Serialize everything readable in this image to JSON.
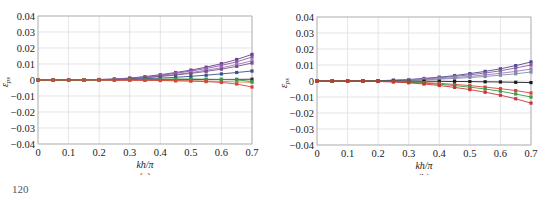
{
  "page_number": "120",
  "chart_data": [
    {
      "type": "line",
      "panel_label": "(a)",
      "title": "",
      "xlabel": "kh/π",
      "ylabel": "ε_ps",
      "xlim": [
        0,
        0.7
      ],
      "ylim": [
        -0.04,
        0.04
      ],
      "xticks": [
        "0",
        "0.1",
        "0.2",
        "0.3",
        "0.4",
        "0.5",
        "0.6",
        "0.7"
      ],
      "yticks": [
        "0.04",
        "0.03",
        "0.02",
        "0.01",
        "0",
        "-0.01",
        "-0.02",
        "-0.03",
        "-0.04"
      ],
      "grid": true,
      "legend": "none",
      "x": [
        0,
        0.05,
        0.1,
        0.15,
        0.2,
        0.25,
        0.3,
        0.35,
        0.4,
        0.45,
        0.5,
        0.55,
        0.6,
        0.65,
        0.7
      ],
      "series": [
        {
          "name": "s1",
          "color": "#6a3d8f",
          "values": [
            0,
            0,
            0,
            0.0001,
            0.0003,
            0.0006,
            0.0012,
            0.0021,
            0.0033,
            0.0047,
            0.0062,
            0.008,
            0.0102,
            0.0128,
            0.016
          ]
        },
        {
          "name": "s2",
          "color": "#8a5aa8",
          "values": [
            0,
            0,
            0,
            0.0001,
            0.0003,
            0.0005,
            0.0011,
            0.0019,
            0.0029,
            0.0042,
            0.0056,
            0.0072,
            0.0091,
            0.0114,
            0.0143
          ]
        },
        {
          "name": "s3",
          "color": "#9c7bb6",
          "values": [
            0,
            0,
            0,
            0.0001,
            0.0002,
            0.0004,
            0.0009,
            0.0016,
            0.0025,
            0.0035,
            0.0047,
            0.0061,
            0.0077,
            0.0097,
            0.012
          ]
        },
        {
          "name": "s4",
          "color": "#7a4f8c",
          "values": [
            0,
            0,
            0,
            0.0001,
            0.0002,
            0.0004,
            0.0008,
            0.0014,
            0.0022,
            0.0031,
            0.0041,
            0.0054,
            0.0068,
            0.0085,
            0.0106
          ]
        },
        {
          "name": "s5",
          "color": "#3a4f8f",
          "values": [
            0,
            0,
            0,
            0,
            0.0001,
            0.0002,
            0.0004,
            0.0008,
            0.0012,
            0.0017,
            0.0023,
            0.003,
            0.0038,
            0.0047,
            0.0056
          ]
        },
        {
          "name": "s6",
          "color": "#333333",
          "values": [
            0,
            0,
            0,
            0,
            0,
            0,
            0.0001,
            0.0001,
            0.0002,
            0.0002,
            0.0003,
            0.0003,
            0.0004,
            0.0004,
            0.0005
          ]
        },
        {
          "name": "s7",
          "color": "#d98a4e",
          "values": [
            0,
            0,
            0,
            0,
            0,
            -0.0001,
            -0.0001,
            -0.0002,
            -0.0003,
            -0.0004,
            -0.0005,
            -0.0007,
            -0.0009,
            -0.0012,
            -0.0015
          ]
        },
        {
          "name": "s8",
          "color": "#3a9a4a",
          "values": [
            0,
            0,
            0,
            0,
            0.0001,
            0.0002,
            0.0003,
            0.0004,
            0.0005,
            0.0006,
            0.0006,
            0.0005,
            0.0003,
            0.0001,
            -0.001
          ]
        },
        {
          "name": "s9",
          "color": "#d6453a",
          "values": [
            0,
            0,
            0,
            0,
            0,
            -0.0001,
            -0.0001,
            -0.0002,
            -0.0003,
            -0.0005,
            -0.0007,
            -0.001,
            -0.0015,
            -0.0025,
            -0.0044
          ]
        }
      ]
    },
    {
      "type": "line",
      "panel_label": "(b)",
      "title": "",
      "xlabel": "kh/π",
      "ylabel": "ε_ps",
      "xlim": [
        0,
        0.7
      ],
      "ylim": [
        -0.04,
        0.04
      ],
      "xticks": [
        "0",
        "0.1",
        "0.2",
        "0.3",
        "0.4",
        "0.5",
        "0.6",
        "0.7"
      ],
      "yticks": [
        "0.04",
        "0.03",
        "0.02",
        "0.01",
        "0",
        "-0.01",
        "-0.02",
        "-0.03",
        "-0.04"
      ],
      "grid": true,
      "legend": "none",
      "x": [
        0,
        0.05,
        0.1,
        0.15,
        0.2,
        0.25,
        0.3,
        0.35,
        0.4,
        0.45,
        0.5,
        0.55,
        0.6,
        0.65,
        0.7
      ],
      "series": [
        {
          "name": "s1",
          "color": "#4a4a8f",
          "values": [
            0,
            0,
            0,
            0.0001,
            0.0002,
            0.0005,
            0.0009,
            0.0016,
            0.0024,
            0.0034,
            0.0046,
            0.006,
            0.0076,
            0.0096,
            0.0119
          ]
        },
        {
          "name": "s2",
          "color": "#8a5aa8",
          "values": [
            0,
            0,
            0,
            0.0001,
            0.0002,
            0.0004,
            0.0008,
            0.0013,
            0.002,
            0.0029,
            0.0039,
            0.005,
            0.0064,
            0.0081,
            0.01
          ]
        },
        {
          "name": "s3",
          "color": "#9c7bb6",
          "values": [
            0,
            0,
            0,
            0,
            0.0001,
            0.0003,
            0.0006,
            0.001,
            0.0015,
            0.0021,
            0.0029,
            0.0038,
            0.0048,
            0.006,
            0.0075
          ]
        },
        {
          "name": "s4",
          "color": "#7f8fa8",
          "values": [
            0,
            0,
            0,
            0,
            0.0001,
            0.0002,
            0.0004,
            0.0007,
            0.0011,
            0.0016,
            0.0022,
            0.0028,
            0.0036,
            0.0045,
            0.0056
          ]
        },
        {
          "name": "s5",
          "color": "#1a1a1a",
          "values": [
            0,
            0,
            0,
            0,
            0,
            0,
            -0.0001,
            -0.0001,
            -0.0002,
            -0.0003,
            -0.0004,
            -0.0005,
            -0.0006,
            -0.0008,
            -0.001
          ]
        },
        {
          "name": "s6",
          "color": "#d6453a",
          "values": [
            0,
            0,
            0,
            0,
            -0.0001,
            -0.0003,
            -0.0006,
            -0.001,
            -0.0015,
            -0.0021,
            -0.0029,
            -0.0038,
            -0.0048,
            -0.006,
            -0.0075
          ]
        },
        {
          "name": "s7",
          "color": "#3a9a4a",
          "values": [
            0,
            0,
            0,
            -0.0001,
            -0.0002,
            -0.0004,
            -0.0008,
            -0.0013,
            -0.002,
            -0.0029,
            -0.0039,
            -0.005,
            -0.0064,
            -0.0081,
            -0.01
          ]
        },
        {
          "name": "s8",
          "color": "#cc3333",
          "values": [
            0,
            0,
            0,
            -0.0001,
            -0.0003,
            -0.0006,
            -0.0011,
            -0.0019,
            -0.0028,
            -0.004,
            -0.0054,
            -0.007,
            -0.0089,
            -0.0111,
            -0.0138
          ]
        }
      ]
    }
  ]
}
